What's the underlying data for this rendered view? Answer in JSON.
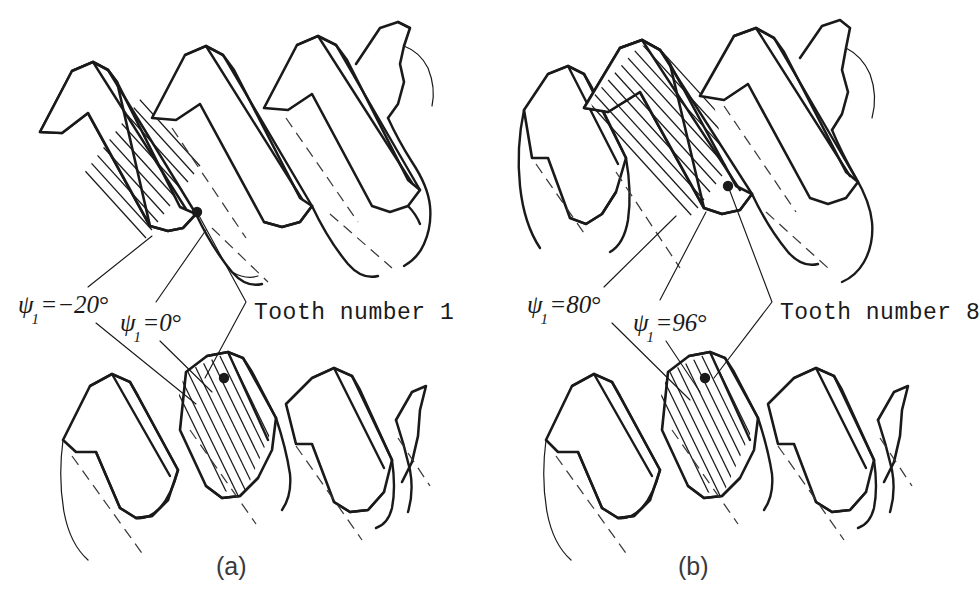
{
  "figure": {
    "background_color": "#ffffff",
    "ink_color": "#1a1a1a",
    "panels": [
      {
        "id": "a",
        "caption": "(a)",
        "tooth_label": "Tooth number 1",
        "angles": [
          {
            "symbol": "ψ",
            "subscript": "1",
            "equals": "=",
            "value": "−20",
            "unit": "°"
          },
          {
            "symbol": "ψ",
            "subscript": "1",
            "equals": "=",
            "value": "0",
            "unit": "°"
          }
        ]
      },
      {
        "id": "b",
        "caption": "(b)",
        "tooth_label": "Tooth number 8",
        "angles": [
          {
            "symbol": "ψ",
            "subscript": "1",
            "equals": "=",
            "value": "80",
            "unit": "°"
          },
          {
            "symbol": "ψ",
            "subscript": "1",
            "equals": "=",
            "value": "96",
            "unit": "°"
          }
        ]
      }
    ]
  },
  "labels": {
    "a_psi_left": {
      "sym": "ψ",
      "sub": "1",
      "eq": "=",
      "val": "−20",
      "deg": "°"
    },
    "a_psi_right": {
      "sym": "ψ",
      "sub": "1",
      "eq": "=",
      "val": "0",
      "deg": "°"
    },
    "a_tooth": "Tooth number 1",
    "a_caption": "(a)",
    "b_psi_left": {
      "sym": "ψ",
      "sub": "1",
      "eq": "=",
      "val": "80",
      "deg": "°"
    },
    "b_psi_right": {
      "sym": "ψ",
      "sub": "1",
      "eq": "=",
      "val": "96",
      "deg": "°"
    },
    "b_tooth": "Tooth number 8",
    "b_caption": "(b)"
  }
}
